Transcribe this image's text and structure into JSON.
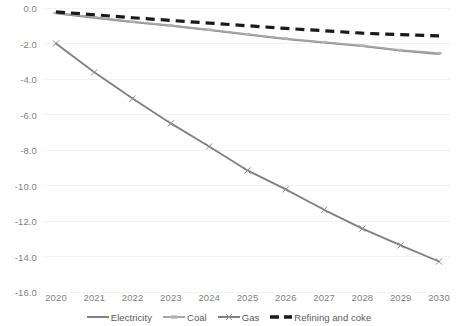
{
  "chart_data": {
    "type": "line",
    "title": "",
    "subtitle": "",
    "xlabel": "",
    "ylabel": "",
    "categories": [
      "2020",
      "2021",
      "2022",
      "2023",
      "2024",
      "2025",
      "2026",
      "2027",
      "2028",
      "2029",
      "2030"
    ],
    "x": [
      2020,
      2021,
      2022,
      2023,
      2024,
      2025,
      2026,
      2027,
      2028,
      2029,
      2030
    ],
    "ylim": [
      -16.0,
      0.0
    ],
    "y_ticks": [
      0.0,
      -2.0,
      -4.0,
      -6.0,
      -8.0,
      -10.0,
      -12.0,
      -14.0,
      -16.0
    ],
    "y_tick_labels": [
      "0.0",
      "-2.0",
      "-4.0",
      "-6.0",
      "-8.0",
      "-10.0",
      "-12.0",
      "-14.0",
      "-16.0"
    ],
    "grid": true,
    "grid_axis": "y",
    "grid_color": "#f2f2f2",
    "legend_position": "bottom",
    "series": [
      {
        "name": "Electricity",
        "color": "#808080",
        "style": "solid",
        "marker": "none",
        "values": [
          -0.3,
          -0.55,
          -0.8,
          -1.0,
          -1.25,
          -1.5,
          -1.75,
          -1.95,
          -2.15,
          -2.4,
          -2.6
        ]
      },
      {
        "name": "Coal",
        "color": "#a6a6a6",
        "style": "solid",
        "marker": "dash",
        "values": [
          -0.28,
          -0.52,
          -0.77,
          -0.98,
          -1.22,
          -1.47,
          -1.72,
          -1.92,
          -2.12,
          -2.37,
          -2.55
        ]
      },
      {
        "name": "Gas",
        "color": "#808080",
        "style": "solid",
        "marker": "x",
        "values": [
          -2.0,
          -3.62,
          -5.1,
          -6.5,
          -7.8,
          -9.15,
          -10.22,
          -11.37,
          -12.43,
          -13.37,
          -14.28
        ]
      },
      {
        "name": "Refining and coke",
        "color": "#1a1a1a",
        "style": "dashed",
        "marker": "none",
        "values": [
          -0.22,
          -0.38,
          -0.55,
          -0.7,
          -0.85,
          -1.0,
          -1.15,
          -1.28,
          -1.42,
          -1.5,
          -1.57
        ]
      }
    ]
  },
  "legend": {
    "items": [
      {
        "label": "Electricity"
      },
      {
        "label": "Coal"
      },
      {
        "label": "Gas"
      },
      {
        "label": "Refining and coke"
      }
    ]
  }
}
